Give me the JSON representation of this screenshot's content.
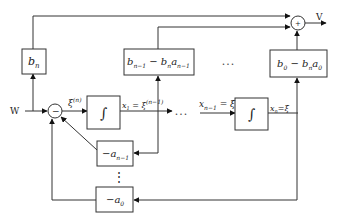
{
  "diagram": {
    "type": "state-space block diagram (controllable canonical form)",
    "input_label": "W",
    "output_label": "V",
    "sum_left_sign": "−",
    "sum_right_sign": "+",
    "blocks": {
      "bn": {
        "main": "b",
        "sub": "n"
      },
      "b_n1": {
        "text": "b",
        "sub1": "n−1",
        "mid": " − b",
        "sub2": "n",
        "a": "a",
        "sub3": "n−1"
      },
      "b_0": {
        "text": "b",
        "sub1": "0",
        "mid": " − b",
        "sub2": "n",
        "a": "a",
        "sub3": "0"
      },
      "integrator1": {
        "symbol": "∫"
      },
      "integrator2": {
        "symbol": "∫"
      },
      "neg_a_n1": {
        "text": "−a",
        "sub": "n−1"
      },
      "neg_a_0": {
        "text": "−a",
        "sub": "0"
      }
    },
    "signals": {
      "xi_n": {
        "base": "ξ",
        "sup": "(n)"
      },
      "x1": {
        "x": "x",
        "sub": "1",
        "eq": " = ",
        "base": "ξ",
        "sup": "(n−1)"
      },
      "xn1": {
        "x": "x",
        "sub": "n−1",
        "eq": " = ",
        "base": "ξ̇"
      },
      "xn": {
        "x": "x",
        "sub": "n",
        "eq": "=",
        "base": "ξ"
      }
    },
    "ellipsis_h": "• • •",
    "ellipsis_h2": "• • •",
    "ellipsis_v": "⋮"
  }
}
